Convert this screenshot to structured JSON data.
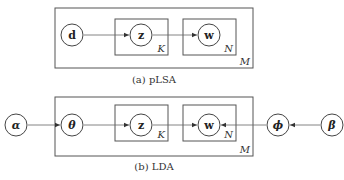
{
  "diagrams": {
    "plsa": {
      "caption": "(a)   pLSA",
      "nodes": {
        "d": "d",
        "z": "z",
        "w": "w"
      },
      "plates": {
        "outer": "M",
        "topic": "K",
        "word": "N"
      },
      "edges": [
        [
          "d",
          "z"
        ],
        [
          "z",
          "w"
        ]
      ]
    },
    "lda": {
      "caption": "(b)   LDA",
      "nodes": {
        "alpha": "α",
        "theta": "θ",
        "z": "z",
        "w": "w",
        "phi": "ϕ",
        "beta": "β"
      },
      "plates": {
        "outer": "M",
        "topic": "K",
        "word": "N"
      },
      "edges": [
        [
          "alpha",
          "theta"
        ],
        [
          "theta",
          "z"
        ],
        [
          "z",
          "w"
        ],
        [
          "phi",
          "w"
        ],
        [
          "beta",
          "phi"
        ]
      ]
    }
  }
}
